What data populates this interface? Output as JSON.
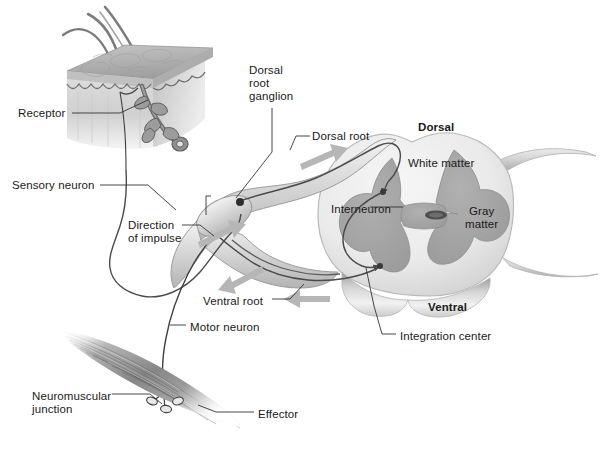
{
  "figure": {
    "background_color": "#ffffff"
  },
  "palette": {
    "ink": "#1a1a1a",
    "leader_line": "#333333",
    "arrow_gray": "#b4b4b4",
    "gray_matter": "#a6a6a6",
    "gray_matter_dark": "#8f8f8f",
    "white_matter": "#e9e9e9",
    "white_matter_edge": "#c9c9c9",
    "nerve_fill": "#dcdcdc",
    "nerve_edge": "#9a9a9a",
    "neuron_line": "#4a4a4a",
    "skin_epidermis": "#b9b9b9",
    "skin_dermis": "#d6d6d6",
    "muscle_dark": "#6e6e6e",
    "muscle_light": "#cfcfcf",
    "hair": "#7a7a7a",
    "central_canal": "#5a5a5a"
  },
  "labels": [
    {
      "id": "receptor",
      "text": "Receptor",
      "x": 18,
      "y": 107,
      "align": "left",
      "bold": false
    },
    {
      "id": "sensory-neuron",
      "text": "Sensory neuron",
      "x": 12,
      "y": 179,
      "align": "left",
      "bold": false
    },
    {
      "id": "dorsal-root-ganglion",
      "text": "Dorsal\nroot\nganglion",
      "x": 249,
      "y": 64,
      "align": "left",
      "bold": false
    },
    {
      "id": "dorsal-root",
      "text": "Dorsal root",
      "x": 312,
      "y": 130,
      "align": "left",
      "bold": false
    },
    {
      "id": "dorsal",
      "text": "Dorsal",
      "x": 418,
      "y": 121,
      "align": "left",
      "bold": true
    },
    {
      "id": "white-matter",
      "text": "White matter",
      "x": 408,
      "y": 157,
      "align": "left",
      "bold": false
    },
    {
      "id": "interneuron",
      "text": "Interneuron",
      "x": 331,
      "y": 203,
      "align": "left",
      "bold": false
    },
    {
      "id": "gray-matter",
      "text": "Gray\nmatter",
      "x": 465,
      "y": 205,
      "align": "left",
      "bold": false
    },
    {
      "id": "direction-of-impulse",
      "text": "Direction\nof impulse",
      "x": 128,
      "y": 219,
      "align": "left",
      "bold": false
    },
    {
      "id": "ventral-root",
      "text": "Ventral root",
      "x": 203,
      "y": 295,
      "align": "left",
      "bold": false
    },
    {
      "id": "ventral",
      "text": "Ventral",
      "x": 428,
      "y": 301,
      "align": "left",
      "bold": true
    },
    {
      "id": "motor-neuron",
      "text": "Motor neuron",
      "x": 190,
      "y": 321,
      "align": "left",
      "bold": false
    },
    {
      "id": "integration-center",
      "text": "Integration center",
      "x": 400,
      "y": 330,
      "align": "left",
      "bold": false
    },
    {
      "id": "neuromuscular-junction",
      "text": "Neuromuscular\njunction",
      "x": 32,
      "y": 390,
      "align": "left",
      "bold": false
    },
    {
      "id": "effector",
      "text": "Effector",
      "x": 258,
      "y": 408,
      "align": "left",
      "bold": false
    }
  ],
  "structures": [
    {
      "id": "skin-block",
      "name": "Skin block with hair follicle receptor"
    },
    {
      "id": "spinal-cord",
      "name": "Spinal cord cross section"
    },
    {
      "id": "gray-matter-shape",
      "name": "Butterfly-shaped gray matter"
    },
    {
      "id": "central-canal",
      "name": "Central canal"
    },
    {
      "id": "dorsal-root-nerve",
      "name": "Dorsal root with ganglion"
    },
    {
      "id": "ventral-root-nerve",
      "name": "Ventral root"
    },
    {
      "id": "sensory-fiber",
      "name": "Sensory neuron fiber"
    },
    {
      "id": "motor-fiber",
      "name": "Motor neuron fiber"
    },
    {
      "id": "interneuron-fiber",
      "name": "Interneuron fiber"
    },
    {
      "id": "muscle",
      "name": "Skeletal muscle effector"
    },
    {
      "id": "nmj",
      "name": "Neuromuscular junction endings"
    }
  ],
  "impulse_arrows": [
    {
      "id": "arrow-dorsal-in",
      "direction": "toward-cord",
      "position": "dorsal-root-upper"
    },
    {
      "id": "arrow-sensory-in",
      "direction": "toward-cord",
      "position": "sensory-fiber-lower-left"
    },
    {
      "id": "arrow-ventral-out",
      "direction": "away-from-cord",
      "position": "ventral-root-left"
    },
    {
      "id": "arrow-ventral-in",
      "direction": "away-from-cord",
      "position": "ventral-root-right"
    }
  ]
}
